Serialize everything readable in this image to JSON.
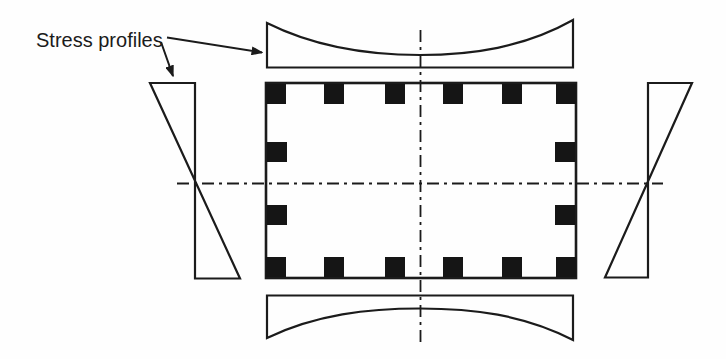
{
  "figure": {
    "label": "Stress profiles",
    "colors": {
      "line": "#1b1b1b",
      "background": "#fefefe",
      "rebar": "#151515"
    },
    "section": {
      "shape": "rectangle",
      "rebar_count": 16,
      "rebar_top_row": 6,
      "rebar_bottom_row": 6,
      "rebar_left_side_middle": 2,
      "rebar_right_side_middle": 2
    },
    "profiles": [
      "top-flange-nonuniform-concave",
      "bottom-flange-nonuniform-concave",
      "left-web-linear-triangular",
      "right-web-linear-triangular"
    ]
  }
}
